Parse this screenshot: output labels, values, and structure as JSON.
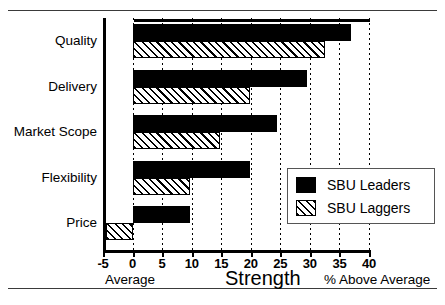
{
  "chart_data": {
    "type": "bar",
    "orientation": "horizontal",
    "title": "",
    "xlabel": "Strength",
    "ylabel": "",
    "xlim": [
      -5,
      40
    ],
    "ylim": null,
    "grid": true,
    "grid_axis": "x",
    "grid_style": "dotted",
    "legend_position": "inner right",
    "categories": [
      "Quality",
      "Delivery",
      "Market Scope",
      "Flexibility",
      "Price"
    ],
    "series": [
      {
        "name": "SBU Leaders",
        "fill": "solid-black",
        "color": "#000000",
        "values": [
          37,
          29.5,
          24.5,
          19.8,
          9.8
        ]
      },
      {
        "name": "SBU Laggers",
        "fill": "diagonal-hatch",
        "color": "#FFFFFF",
        "values": [
          32.5,
          19.8,
          14.8,
          9.8,
          -4.5
        ]
      }
    ],
    "xticks": [
      -5,
      0,
      5,
      10,
      15,
      20,
      25,
      30,
      35,
      40
    ],
    "xticklabels": [
      "-5",
      "0",
      "5",
      "10",
      "15",
      "20",
      "25",
      "30",
      "35",
      "40"
    ],
    "annotations": [
      {
        "text": "Average",
        "position": "below-axis-left"
      },
      {
        "text": "% Above Average",
        "position": "below-axis-right"
      }
    ]
  },
  "legend": {
    "items": [
      {
        "label": "SBU Leaders",
        "swatch": "solid-black-swatch"
      },
      {
        "label": "SBU Laggers",
        "swatch": "hatched-swatch"
      }
    ]
  },
  "axis": {
    "title": "Strength",
    "note_left": "Average",
    "note_right": "% Above Average"
  }
}
